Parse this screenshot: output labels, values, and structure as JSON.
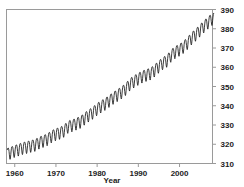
{
  "chart_data": {
    "type": "line",
    "title": "",
    "xlabel": "Year",
    "ylabel": "",
    "xlim": [
      1958,
      2008
    ],
    "ylim": [
      310,
      390
    ],
    "grid": true,
    "legend_position": "none",
    "y_axis_side": "right",
    "x_ticks": [
      1960,
      1970,
      1980,
      1990,
      2000
    ],
    "x_tick_labels": [
      "1960",
      "1970",
      "1980",
      "1990",
      "2000"
    ],
    "y_ticks": [
      310,
      320,
      330,
      340,
      350,
      360,
      370,
      380,
      390
    ],
    "y_tick_labels": [
      "310",
      "320",
      "330",
      "340",
      "350",
      "360",
      "370",
      "380",
      "390"
    ],
    "series": [
      {
        "name": "Atmospheric CO2",
        "color": "#1a1a1a",
        "description": "Monthly mean CO2 with seasonal sawtooth oscillation of about 6 ppm peak-to-trough superimposed on a rising trend",
        "annual_mean_x": [
          1958,
          1959,
          1960,
          1961,
          1962,
          1963,
          1964,
          1965,
          1966,
          1967,
          1968,
          1969,
          1970,
          1971,
          1972,
          1973,
          1974,
          1975,
          1976,
          1977,
          1978,
          1979,
          1980,
          1981,
          1982,
          1983,
          1984,
          1985,
          1986,
          1987,
          1988,
          1989,
          1990,
          1991,
          1992,
          1993,
          1994,
          1995,
          1996,
          1997,
          1998,
          1999,
          2000,
          2001,
          2002,
          2003,
          2004,
          2005,
          2006,
          2007,
          2008
        ],
        "annual_mean_y": [
          315.3,
          315.9,
          316.9,
          317.6,
          318.4,
          318.9,
          319.5,
          320.0,
          321.3,
          322.1,
          323.0,
          324.6,
          325.6,
          326.3,
          327.4,
          329.6,
          330.2,
          331.1,
          332.0,
          333.8,
          335.4,
          336.8,
          338.7,
          340.1,
          341.4,
          343.0,
          344.6,
          346.0,
          347.4,
          349.2,
          351.6,
          353.1,
          354.4,
          355.6,
          356.4,
          357.1,
          358.8,
          360.8,
          362.6,
          363.8,
          366.6,
          368.3,
          369.5,
          371.0,
          373.1,
          375.6,
          377.4,
          379.6,
          381.8,
          383.7,
          385.6
        ]
      }
    ]
  },
  "axis": {
    "x_title": "Year",
    "x_labels": [
      "1960",
      "1970",
      "1980",
      "1990",
      "2000"
    ],
    "y_labels": [
      "390",
      "380",
      "370",
      "360",
      "350",
      "340",
      "330",
      "320",
      "310"
    ]
  }
}
